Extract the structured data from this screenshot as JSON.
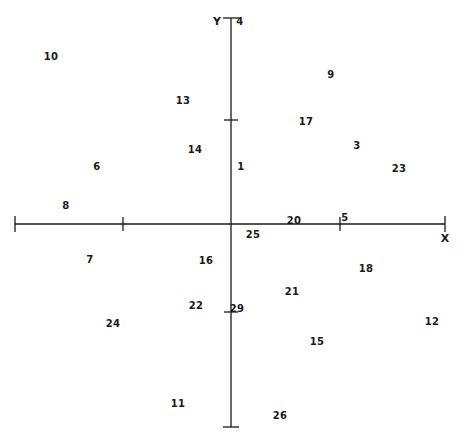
{
  "chart_data": {
    "type": "scatter",
    "title": "",
    "subtitle": "",
    "xlabel": "X",
    "ylabel": "Y",
    "grid": false,
    "legend": null,
    "annotations": [],
    "axes": {
      "origin_px": [
        231,
        224
      ],
      "x_axis_px": [
        15,
        445
      ],
      "y_axis_px": [
        18,
        427
      ],
      "x_tick_px": [
        123,
        340
      ],
      "y_tick_px": [
        120,
        312
      ],
      "x_tick_labels": [],
      "y_tick_labels": [],
      "axis_color": "#1a1a1a"
    },
    "point_label_style": "numeric-text-marker",
    "points": [
      {
        "label": "10",
        "px": 51,
        "py": 57
      },
      {
        "label": "4",
        "px": 240,
        "py": 22
      },
      {
        "label": "9",
        "px": 331,
        "py": 75
      },
      {
        "label": "13",
        "px": 183,
        "py": 101
      },
      {
        "label": "17",
        "px": 306,
        "py": 122
      },
      {
        "label": "14",
        "px": 195,
        "py": 150
      },
      {
        "label": "3",
        "px": 357,
        "py": 146
      },
      {
        "label": "1",
        "px": 241,
        "py": 167
      },
      {
        "label": "23",
        "px": 399,
        "py": 169
      },
      {
        "label": "6",
        "px": 97,
        "py": 167
      },
      {
        "label": "8",
        "px": 66,
        "py": 206
      },
      {
        "label": "20",
        "px": 294,
        "py": 221
      },
      {
        "label": "5",
        "px": 345,
        "py": 218
      },
      {
        "label": "25",
        "px": 253,
        "py": 235
      },
      {
        "label": "7",
        "px": 90,
        "py": 260
      },
      {
        "label": "16",
        "px": 206,
        "py": 261
      },
      {
        "label": "18",
        "px": 366,
        "py": 269
      },
      {
        "label": "21",
        "px": 292,
        "py": 292
      },
      {
        "label": "22",
        "px": 196,
        "py": 306
      },
      {
        "label": "29",
        "px": 237,
        "py": 309
      },
      {
        "label": "24",
        "px": 113,
        "py": 324
      },
      {
        "label": "15",
        "px": 317,
        "py": 342
      },
      {
        "label": "12",
        "px": 432,
        "py": 322
      },
      {
        "label": "11",
        "px": 178,
        "py": 404
      },
      {
        "label": "26",
        "px": 280,
        "py": 416
      }
    ],
    "axis_labels": [
      {
        "name": "Y",
        "px": 217,
        "py": 21
      },
      {
        "name": "X",
        "px": 445,
        "py": 238
      }
    ]
  }
}
